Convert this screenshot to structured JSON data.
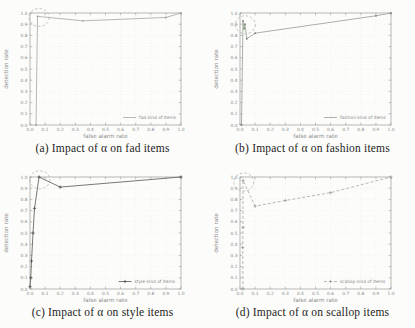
{
  "figure": {
    "description_visible_text_only": true,
    "x_axis_label": "false alarm rate",
    "y_axis_label": "detection rate",
    "tick_labels": [
      "0.0",
      "0.1",
      "0.2",
      "0.3",
      "0.4",
      "0.5",
      "0.6",
      "0.7",
      "0.8",
      "0.9",
      "1.0"
    ]
  },
  "colors": {
    "axis": "#9a9a9a",
    "tick_text": "#8a8a8a",
    "grid": "#e9e9e6",
    "annotation_circle": "#b3b3ae",
    "caption_text": "#1c1c1c"
  },
  "chart_data": [
    {
      "id": "a",
      "type": "line",
      "caption": "(a) Impact of α on fad items",
      "legend": "fad kind of items",
      "xlabel": "false alarm rate",
      "ylabel": "detection rate",
      "xlim": [
        0,
        1
      ],
      "ylim": [
        0,
        1
      ],
      "xticks": [
        "0.0",
        "0.1",
        "0.2",
        "0.3",
        "0.4",
        "0.5",
        "0.6",
        "0.7",
        "0.8",
        "0.9",
        "1.0"
      ],
      "yticks": [
        "0.0",
        "0.1",
        "0.2",
        "0.3",
        "0.4",
        "0.5",
        "0.6",
        "0.7",
        "0.8",
        "0.9",
        "1.0"
      ],
      "grid": true,
      "legend_position": "bottom-right",
      "color": "#a9b3a6",
      "dash": "",
      "marker": "dot",
      "marker_color": "#97a294",
      "points": [
        [
          0.04,
          0.0
        ],
        [
          0.05,
          0.97
        ],
        [
          0.35,
          0.93
        ],
        [
          0.9,
          0.96
        ],
        [
          1.0,
          1.0
        ]
      ],
      "annotation_circle": {
        "x": 0.06,
        "y": 0.96
      }
    },
    {
      "id": "b",
      "type": "line",
      "caption": "(b) Impact of α on fashion items",
      "legend": "fashion kind of items",
      "xlabel": "false alarm rate",
      "ylabel": "detection rate",
      "xlim": [
        0,
        1
      ],
      "ylim": [
        0,
        1
      ],
      "xticks": [
        "0.0",
        "0.1",
        "0.2",
        "0.3",
        "0.4",
        "0.5",
        "0.6",
        "0.7",
        "0.8",
        "0.9",
        "1.0"
      ],
      "yticks": [
        "0.0",
        "0.1",
        "0.2",
        "0.3",
        "0.4",
        "0.5",
        "0.6",
        "0.7",
        "0.8",
        "0.9",
        "1.0"
      ],
      "grid": true,
      "legend_position": "bottom-right",
      "color": "#9fa99d",
      "dash": "",
      "marker": "dot",
      "marker_color": "#79836f",
      "points": [
        [
          0.01,
          0.0
        ],
        [
          0.02,
          0.93
        ],
        [
          0.027,
          0.86
        ],
        [
          0.033,
          0.9
        ],
        [
          0.045,
          0.77
        ],
        [
          0.1,
          0.82
        ],
        [
          0.9,
          0.975
        ],
        [
          1.0,
          1.0
        ]
      ],
      "annotation_circle": {
        "x": 0.035,
        "y": 0.895
      }
    },
    {
      "id": "c",
      "type": "line",
      "caption": "(c) Impact of α on style items",
      "legend": "style kind of items",
      "xlabel": "false alarm rate",
      "ylabel": "detection rate",
      "xlim": [
        0,
        1
      ],
      "ylim": [
        0,
        1
      ],
      "xticks": [
        "0.0",
        "0.1",
        "0.2",
        "0.3",
        "0.4",
        "0.5",
        "0.6",
        "0.7",
        "0.8",
        "0.9",
        "1.0"
      ],
      "yticks": [
        "0.0",
        "0.1",
        "0.2",
        "0.3",
        "0.4",
        "0.5",
        "0.6",
        "0.7",
        "0.8",
        "0.9",
        "1.0"
      ],
      "grid": true,
      "legend_position": "bottom-right",
      "color": "#666c62",
      "dash": "",
      "marker": "plus",
      "marker_color": "#4c524a",
      "points": [
        [
          0.0,
          0.02
        ],
        [
          0.005,
          0.1
        ],
        [
          0.01,
          0.25
        ],
        [
          0.02,
          0.5
        ],
        [
          0.03,
          0.72
        ],
        [
          0.06,
          1.0
        ],
        [
          0.2,
          0.91
        ],
        [
          1.0,
          1.0
        ]
      ],
      "annotation_circle": {
        "x": 0.065,
        "y": 0.975
      }
    },
    {
      "id": "d",
      "type": "line",
      "caption": "(d) Impact of α on scallop items",
      "legend": "scallop kind of items",
      "xlabel": "false alarm rate",
      "ylabel": "detection rate",
      "xlim": [
        0,
        1
      ],
      "ylim": [
        0,
        1
      ],
      "xticks": [
        "0.0",
        "0.1",
        "0.2",
        "0.3",
        "0.4",
        "0.5",
        "0.6",
        "0.7",
        "0.8",
        "0.9",
        "1.0"
      ],
      "yticks": [
        "0.0",
        "0.1",
        "0.2",
        "0.3",
        "0.4",
        "0.5",
        "0.6",
        "0.7",
        "0.8",
        "0.9",
        "1.0"
      ],
      "grid": true,
      "legend_position": "bottom-right",
      "color": "#aab4a4",
      "dash": "3,2",
      "marker": "plus",
      "marker_color": "#99a393",
      "points": [
        [
          0.02,
          0.0
        ],
        [
          0.018,
          0.37
        ],
        [
          0.02,
          0.55
        ],
        [
          0.02,
          0.97
        ],
        [
          0.1,
          0.74
        ],
        [
          0.3,
          0.79
        ],
        [
          0.6,
          0.86
        ],
        [
          1.0,
          1.0
        ]
      ],
      "annotation_circle": {
        "x": 0.025,
        "y": 0.955
      }
    }
  ]
}
